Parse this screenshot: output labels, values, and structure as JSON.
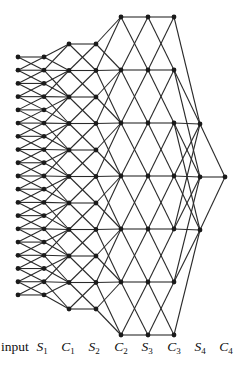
{
  "diagram": {
    "type": "layered-network",
    "node_color": "#1a1a1a",
    "edge_color": "#2a2a2a",
    "layers": [
      {
        "id": "input",
        "label": "input",
        "label_main": "input",
        "label_sub": "",
        "italic": false,
        "x": 18,
        "label_x": 15,
        "y_start": 57,
        "y_step": 13.22,
        "count": 19
      },
      {
        "id": "S1",
        "label": "S1",
        "label_main": "S",
        "label_sub": "1",
        "italic": true,
        "x": 44,
        "label_x": 42,
        "y_start": 57,
        "y_step": 13.22,
        "count": 19
      },
      {
        "id": "C1",
        "label": "C1",
        "label_main": "C",
        "label_sub": "1",
        "italic": true,
        "x": 69,
        "label_x": 68,
        "y_start": 44,
        "y_step": 26.5,
        "count": 11
      },
      {
        "id": "S2",
        "label": "S2",
        "label_main": "S",
        "label_sub": "2",
        "italic": true,
        "x": 96,
        "label_x": 94,
        "y_start": 44,
        "y_step": 26.5,
        "count": 11
      },
      {
        "id": "C2",
        "label": "C2",
        "label_main": "C",
        "label_sub": "2",
        "italic": true,
        "x": 121,
        "label_x": 121,
        "y_start": 17,
        "y_step": 53,
        "count": 7
      },
      {
        "id": "S3",
        "label": "S3",
        "label_main": "S",
        "label_sub": "3",
        "italic": true,
        "x": 148,
        "label_x": 147,
        "y_start": 17,
        "y_step": 53,
        "count": 7
      },
      {
        "id": "C3",
        "label": "C3",
        "label_main": "C",
        "label_sub": "3",
        "italic": true,
        "x": 174,
        "label_x": 174,
        "y_start": 17,
        "y_step": 53,
        "count": 7
      },
      {
        "id": "S4",
        "label": "S4",
        "label_main": "S",
        "label_sub": "4",
        "italic": true,
        "x": 200,
        "label_x": 200,
        "y_start": 124,
        "y_step": 53,
        "count": 3
      },
      {
        "id": "C4",
        "label": "C4",
        "label_main": "C",
        "label_sub": "4",
        "italic": true,
        "x": 225,
        "label_x": 226,
        "y_start": 177,
        "y_step": 53,
        "count": 1
      }
    ],
    "connections": [
      {
        "from": "input",
        "to": "S1",
        "radius_px": 14
      },
      {
        "from": "S1",
        "to": "C1",
        "radius_px": 28
      },
      {
        "from": "C1",
        "to": "S2",
        "radius_px": 27
      },
      {
        "from": "S2",
        "to": "C2",
        "radius_px": 55
      },
      {
        "from": "C2",
        "to": "S3",
        "radius_px": 54
      },
      {
        "from": "S3",
        "to": "C3",
        "radius_px": 54
      },
      {
        "from": "C3",
        "to": "S4",
        "radius_px": 108
      },
      {
        "from": "S4",
        "to": "C4",
        "radius_px": 54
      }
    ]
  }
}
